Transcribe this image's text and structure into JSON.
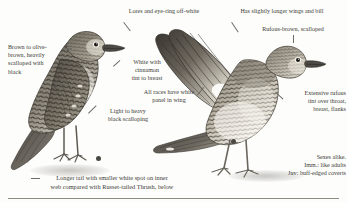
{
  "plate": {
    "background_color": "#fdfdfb",
    "text_color": "#3b3a36",
    "leader_color": "#6e6c66",
    "rule_color": "#8d8b84"
  },
  "annotations": {
    "lores_eyering": "Lores and eye-ring off-white",
    "wings_bill": "Has slightly longer wings and bill",
    "rufous_brown": "Rufous-brown, scalloped",
    "brown_olive": "Brown to olive-\nbrown, heavily\nscalloped with\nblack",
    "white_cinnamon": "White with\ncinnamon\ntint to breast",
    "white_panel": "All races have white\npanel in wing",
    "light_heavy": "Light to heavy\nblack scalloping",
    "extensive_rufous": "Extensive rufous\ntint over throat,\nbreast, flanks",
    "sexes": "Sexes alike.\nImm.: like adults\nJuv: buff-edged coverts",
    "tail_caption": "Longer tail with smaller white spot on inner\nweb compared with Russet-tailed Thrush, below"
  },
  "figures": [
    {
      "name": "perched-thrush",
      "pose": "standing, facing right, folded wings"
    },
    {
      "name": "wing-raised-thrush",
      "pose": "wings raised showing white underwing panel"
    }
  ],
  "markers": {
    "scale_dot_color": "#4a4843",
    "count": 2
  }
}
